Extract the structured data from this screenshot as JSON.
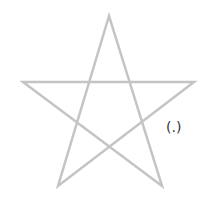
{
  "diagram": {
    "shape": "pentagram",
    "stroke_color": "#c4c4c4",
    "label": "(.)",
    "points": "109,16 58,186 194,82 23,82 162,186"
  }
}
